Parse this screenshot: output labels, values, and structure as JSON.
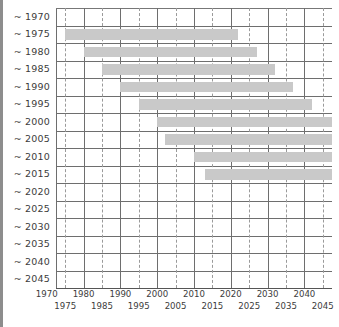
{
  "chart_data": {
    "type": "bar",
    "orientation": "horizontal-range",
    "title": "",
    "subtitle": "",
    "xlabel": "",
    "ylabel": "",
    "grid": true,
    "legend": null,
    "xlim": [
      1972.5,
      2047.5
    ],
    "x_major_ticks": [
      1970,
      1980,
      1990,
      2000,
      2010,
      2020,
      2030,
      2040
    ],
    "x_minor_ticks": [
      1975,
      1985,
      1995,
      2005,
      2015,
      2025,
      2035,
      2045
    ],
    "x_tick_labels_row1": [
      "1970",
      "1980",
      "1990",
      "2000",
      "2010",
      "2020",
      "2030",
      "2040"
    ],
    "x_tick_labels_row2": [
      "1975",
      "1985",
      "1995",
      "2005",
      "2015",
      "2025",
      "2035",
      "2045"
    ],
    "categories": [
      "~ 1970",
      "~ 1975",
      "~ 1980",
      "~ 1985",
      "~ 1990",
      "~ 1995",
      "~ 2000",
      "~ 2005",
      "~ 2010",
      "~ 2015",
      "~ 2020",
      "~ 2025",
      "~ 2030",
      "~ 2035",
      "~ 2040",
      "~ 2045"
    ],
    "bar_color": "#c9c9c9",
    "bars": [
      {
        "category": "~ 1970",
        "start": null,
        "end": null
      },
      {
        "category": "~ 1975",
        "start": 1975,
        "end": 2022
      },
      {
        "category": "~ 1980",
        "start": 1980,
        "end": 2027
      },
      {
        "category": "~ 1985",
        "start": 1985,
        "end": 2032
      },
      {
        "category": "~ 1990",
        "start": 1990,
        "end": 2037
      },
      {
        "category": "~ 1995",
        "start": 1995,
        "end": 2042
      },
      {
        "category": "~ 2000",
        "start": 2000,
        "end": 2047.5
      },
      {
        "category": "~ 2005",
        "start": 2002,
        "end": 2047.5
      },
      {
        "category": "~ 2010",
        "start": 2010,
        "end": 2047.5
      },
      {
        "category": "~ 2015",
        "start": 2013,
        "end": 2047.5
      },
      {
        "category": "~ 2020",
        "start": null,
        "end": null
      },
      {
        "category": "~ 2025",
        "start": null,
        "end": null
      },
      {
        "category": "~ 2030",
        "start": null,
        "end": null
      },
      {
        "category": "~ 2035",
        "start": null,
        "end": null
      },
      {
        "category": "~ 2040",
        "start": null,
        "end": null
      },
      {
        "category": "~ 2045",
        "start": null,
        "end": null
      }
    ]
  }
}
